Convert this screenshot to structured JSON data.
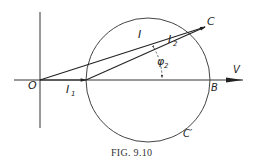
{
  "figure": {
    "caption": "Fig. 9.10",
    "caption_display": "FIG. 9.10",
    "stroke_color": "#333333",
    "labels": {
      "origin": "O",
      "point_c": "C",
      "point_b": "B",
      "point_c_prime": "C′",
      "voltage": "V",
      "current_total": "I",
      "current_1": "I",
      "current_1_sub": "1",
      "current_2": "I",
      "current_2_sub": "2",
      "angle": "φ",
      "angle_sub": "2"
    },
    "elements": [
      {
        "type": "axis-vertical",
        "from": [
          40,
          12
        ],
        "to": [
          40,
          128
        ]
      },
      {
        "type": "axis-horizontal",
        "from": [
          14,
          80
        ],
        "to": [
          243,
          80
        ],
        "label": "V"
      },
      {
        "type": "vector",
        "name": "I1",
        "from": [
          40,
          80
        ],
        "to": [
          86,
          80
        ]
      },
      {
        "type": "vector",
        "name": "I",
        "from": [
          40,
          80
        ],
        "to": [
          205,
          27
        ]
      },
      {
        "type": "vector",
        "name": "I2",
        "from": [
          86,
          80
        ],
        "to": [
          205,
          27
        ]
      },
      {
        "type": "circle",
        "center": [
          148,
          80
        ],
        "radius": 62
      },
      {
        "type": "angle",
        "name": "phi2",
        "between": [
          "I2",
          "V"
        ]
      }
    ]
  }
}
